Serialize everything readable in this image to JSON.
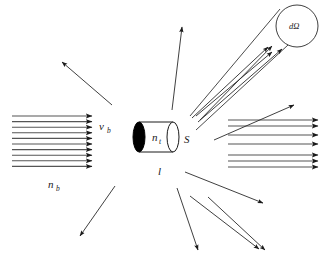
{
  "figure": {
    "background_color": "#ffffff",
    "line_color": "#3a3a3a",
    "dark_line_color": "#1a1a1a",
    "width": 326,
    "height": 255
  },
  "labels": {
    "beam_velocity": "v",
    "beam_velocity_sub": "b",
    "beam_density": "n",
    "beam_density_sub": "b",
    "target_density": "n",
    "target_density_sub": "t",
    "target_area": "S",
    "target_length": "l",
    "solid_angle": "dΩ"
  },
  "beam_in": {
    "name": "incident-beam",
    "arrow_count": 10,
    "x_start": 12,
    "x_end": 92,
    "y_first": 116,
    "y_spacing": 5.6
  },
  "beam_out": {
    "name": "transmitted-beam",
    "arrow_count": 7,
    "x_start": 228,
    "x_end": 318,
    "y_values": [
      120,
      126,
      135,
      144,
      155,
      161,
      167
    ]
  },
  "target": {
    "name": "target-cylinder",
    "left_cx": 139,
    "right_cx": 173,
    "cy": 137,
    "rx": 6,
    "ry": 15
  },
  "scattered_rays": [
    {
      "name": "scatter-up-left",
      "x1": 112,
      "y1": 105,
      "x2": 62,
      "y2": 62
    },
    {
      "name": "scatter-up",
      "x1": 172,
      "y1": 110,
      "x2": 182,
      "y2": 27
    },
    {
      "name": "scatter-up-right",
      "x1": 214,
      "y1": 140,
      "x2": 294,
      "y2": 105
    },
    {
      "name": "scatter-right-upper",
      "x1": 200,
      "y1": 120,
      "x2": 272,
      "y2": 46
    },
    {
      "name": "scatter-down-left",
      "x1": 115,
      "y1": 186,
      "x2": 80,
      "y2": 236
    },
    {
      "name": "scatter-down",
      "x1": 177,
      "y1": 188,
      "x2": 198,
      "y2": 250
    },
    {
      "name": "scatter-down-right-a",
      "x1": 185,
      "y1": 172,
      "x2": 263,
      "y2": 203
    },
    {
      "name": "scatter-down-right-b",
      "x1": 208,
      "y1": 197,
      "x2": 265,
      "y2": 250
    },
    {
      "name": "scatter-down-right-c",
      "x1": 190,
      "y1": 196,
      "x2": 259,
      "y2": 249
    }
  ],
  "cone": {
    "name": "solid-angle-cone",
    "apex_x": 190,
    "apex_y": 116,
    "circle_cx": 297,
    "circle_cy": 26,
    "circle_r": 21,
    "rays": [
      {
        "name": "cone-ray-1",
        "x1": 192,
        "y1": 118,
        "x2": 268,
        "y2": 47
      },
      {
        "name": "cone-ray-2",
        "x1": 196,
        "y1": 116,
        "x2": 272,
        "y2": 52
      },
      {
        "name": "cone-ray-3",
        "x1": 198,
        "y1": 122,
        "x2": 282,
        "y2": 49
      }
    ]
  }
}
